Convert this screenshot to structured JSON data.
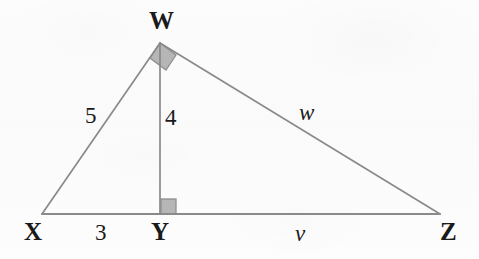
{
  "figure": {
    "background_color": "#fdfdfd",
    "stroke_color": "#8a8a8a",
    "text_color": "#1a1a1a",
    "right_angle_fill": "#b6b6b6",
    "right_angle_stroke": "#8f8f8f",
    "vertices": {
      "W": {
        "label": "W",
        "x": 160,
        "y": 43
      },
      "X": {
        "label": "X",
        "x": 42,
        "y": 214
      },
      "Y": {
        "label": "Y",
        "x": 160,
        "y": 214
      },
      "Z": {
        "label": "Z",
        "x": 440,
        "y": 214
      }
    },
    "segment_labels": {
      "xw": "5",
      "wy": "4",
      "xy": "3",
      "wz": "w",
      "yz": "v"
    },
    "right_angles": [
      {
        "at": "W",
        "shape": "rotated-square-marker"
      },
      {
        "at": "Y",
        "shape": "square-marker"
      }
    ]
  }
}
